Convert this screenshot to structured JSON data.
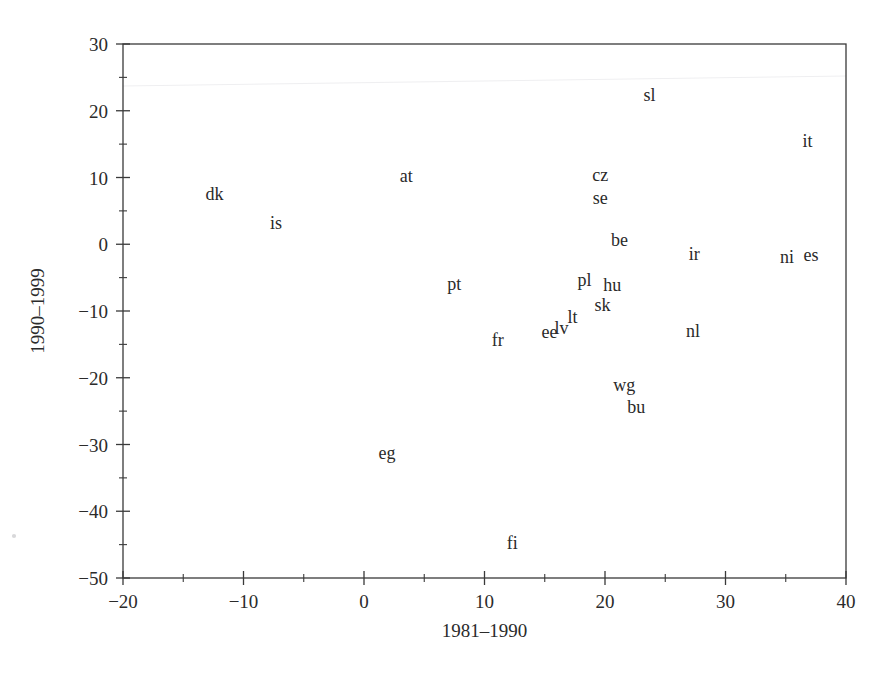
{
  "chart_data": {
    "type": "scatter",
    "title": "",
    "xlabel": "1981–1990",
    "ylabel": "1990–1999",
    "xlim": [
      -20,
      40
    ],
    "ylim": [
      -50,
      30
    ],
    "xticks": [
      -20,
      -10,
      0,
      10,
      20,
      30,
      40
    ],
    "xticklabels": [
      "−20",
      "−10",
      "0",
      "10",
      "20",
      "30",
      "40"
    ],
    "yticks": [
      -50,
      -40,
      -30,
      -20,
      -10,
      0,
      10,
      20,
      30
    ],
    "yticklabels": [
      "−50",
      "−40",
      "−30",
      "−20",
      "−10",
      "0",
      "10",
      "20",
      "30"
    ],
    "xminor_step": 5,
    "yminor_step": 5,
    "grid": false,
    "legend": "none",
    "marker": "text-label",
    "points": [
      {
        "label": "dk",
        "x": -12.4,
        "y": 7.6
      },
      {
        "label": "is",
        "x": -7.3,
        "y": 3.2
      },
      {
        "label": "at",
        "x": 3.5,
        "y": 10.2
      },
      {
        "label": "pt",
        "x": 7.5,
        "y": -5.9
      },
      {
        "label": "fr",
        "x": 11.1,
        "y": -14.3
      },
      {
        "label": "eg",
        "x": 1.9,
        "y": -31.3
      },
      {
        "label": "fi",
        "x": 12.3,
        "y": -44.7
      },
      {
        "label": "ee",
        "x": 15.4,
        "y": -13.2
      },
      {
        "label": "lv",
        "x": 16.4,
        "y": -12.6
      },
      {
        "label": "lt",
        "x": 17.3,
        "y": -10.9
      },
      {
        "label": "pl",
        "x": 18.3,
        "y": -5.3
      },
      {
        "label": "sk",
        "x": 19.8,
        "y": -9.1
      },
      {
        "label": "hu",
        "x": 20.6,
        "y": -6.1
      },
      {
        "label": "cz",
        "x": 19.6,
        "y": 10.3
      },
      {
        "label": "se",
        "x": 19.6,
        "y": 7.0
      },
      {
        "label": "be",
        "x": 21.2,
        "y": 0.6
      },
      {
        "label": "sl",
        "x": 23.7,
        "y": 22.3
      },
      {
        "label": "wg",
        "x": 21.6,
        "y": -21.1
      },
      {
        "label": "bu",
        "x": 22.6,
        "y": -24.4
      },
      {
        "label": "nl",
        "x": 27.3,
        "y": -13.0
      },
      {
        "label": "ir",
        "x": 27.4,
        "y": -1.5
      },
      {
        "label": "ni",
        "x": 35.1,
        "y": -1.9
      },
      {
        "label": "es",
        "x": 37.1,
        "y": -1.6
      },
      {
        "label": "it",
        "x": 36.8,
        "y": 15.4
      }
    ]
  },
  "figure": {
    "background_color": "#ffffff",
    "axis_color": "#3a3a3a",
    "text_color": "#2b2b2b"
  }
}
